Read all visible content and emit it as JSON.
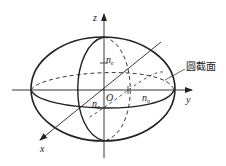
{
  "diagram": {
    "type": "index-ellipsoid",
    "axes": {
      "x": "x",
      "y": "y",
      "z": "z",
      "origin": "O"
    },
    "labels": {
      "ne_base": "n",
      "ne_sub": "e",
      "no_x_base": "n",
      "no_x_sub": "o",
      "no_y_base": "n",
      "no_y_sub": "o",
      "section": "圆截面"
    },
    "colors": {
      "stroke": "#222222",
      "background": "#ffffff"
    }
  }
}
